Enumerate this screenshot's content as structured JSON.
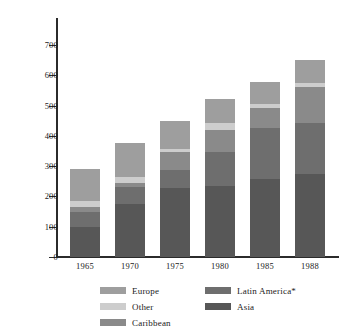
{
  "chart_data": {
    "type": "bar",
    "subtype": "stacked-vertical",
    "title": "",
    "xlabel": "",
    "ylabel": "",
    "categories": [
      "1965",
      "1970",
      "1975",
      "1980",
      "1985",
      "1988"
    ],
    "ylim": [
      0,
      750
    ],
    "yticks": [
      0,
      100,
      200,
      300,
      400,
      500,
      600,
      700
    ],
    "ytick_labels": [
      "0",
      "100",
      "200",
      "300",
      "400",
      "500",
      "600",
      "700"
    ],
    "grid": false,
    "legend_position": "bottom",
    "stack_order_bottom_to_top": [
      "Asia",
      "Latin America*",
      "Caribbean",
      "Other",
      "Europe"
    ],
    "series": [
      {
        "name": "Asia",
        "color": "#575757",
        "values": [
          100,
          175,
          228,
          235,
          258,
          275
        ]
      },
      {
        "name": "Latin America*",
        "color": "#6e6e6e",
        "values": [
          50,
          57,
          60,
          113,
          169,
          168
        ]
      },
      {
        "name": "Caribbean",
        "color": "#8a8a8a",
        "values": [
          15,
          13,
          60,
          72,
          66,
          117
        ]
      },
      {
        "name": "Other",
        "color": "#cdcdcd",
        "values": [
          20,
          20,
          7,
          23,
          13,
          13
        ]
      },
      {
        "name": "Europe",
        "color": "#9e9e9e",
        "values": [
          105,
          110,
          93,
          77,
          71,
          77
        ]
      }
    ],
    "totals": [
      290,
      375,
      388,
      520,
      577,
      650
    ],
    "legend_entries": [
      {
        "label": "Europe",
        "color": "#9e9e9e",
        "column": "left"
      },
      {
        "label": "Other",
        "color": "#cdcdcd",
        "column": "left"
      },
      {
        "label": "Caribbean",
        "color": "#8a8a8a",
        "column": "left"
      },
      {
        "label": "Latin America*",
        "color": "#6e6e6e",
        "column": "right"
      },
      {
        "label": "Asia",
        "color": "#575757",
        "column": "right"
      }
    ]
  },
  "axis": {
    "ytick_labels": [
      "700",
      "600",
      "500",
      "400",
      "300",
      "200",
      "100",
      "0"
    ],
    "xtick_labels": [
      "1965",
      "1970",
      "1975",
      "1980",
      "1985",
      "1988"
    ]
  },
  "legend": {
    "left": [
      {
        "label": "Europe"
      },
      {
        "label": "Other"
      },
      {
        "label": "Caribbean"
      }
    ],
    "right": [
      {
        "label": "Latin America*"
      },
      {
        "label": "Asia"
      }
    ]
  }
}
